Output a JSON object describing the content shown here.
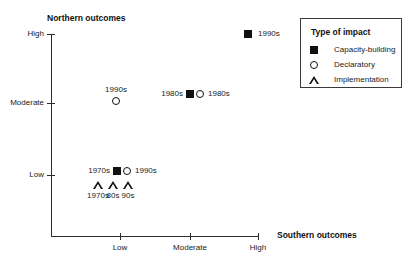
{
  "chart_data": {
    "type": "scatter",
    "title": "",
    "xlabel": "Southern outcomes",
    "ylabel": "Northern outcomes",
    "x_ticks": [
      {
        "label": "Low",
        "px": 120
      },
      {
        "label": "Moderate",
        "px": 190
      },
      {
        "label": "High",
        "px": 258
      }
    ],
    "y_ticks": [
      {
        "label": "High",
        "px": 34
      },
      {
        "label": "Moderate",
        "px": 103
      },
      {
        "label": "Low",
        "px": 175
      }
    ],
    "grid": false,
    "legend": {
      "title": "Type of impact",
      "position": "top-right",
      "entries": [
        {
          "label": "Capacity-building",
          "marker": "filled-square"
        },
        {
          "label": "Declaratory",
          "marker": "open-circle"
        },
        {
          "label": "Implementation",
          "marker": "open-triangle"
        }
      ]
    },
    "points": [
      {
        "id": "capacity-1990s-high",
        "series": "Capacity-building",
        "marker": "filled-square",
        "label": "1990s",
        "label_side": "right",
        "x_value": "High",
        "y_value": "High",
        "px": 248,
        "py": 34,
        "label_px": 258,
        "label_py": 34
      },
      {
        "id": "declaratory-1990s-moderate",
        "series": "Declaratory",
        "marker": "open-circle",
        "label": "1990s",
        "label_side": "above",
        "x_value": "Low",
        "y_value": "Moderate",
        "px": 116,
        "py": 101,
        "label_px": 116,
        "label_py": 86
      },
      {
        "id": "capacity-1980s-moderate",
        "series": "Capacity-building",
        "marker": "filled-square",
        "label": "1980s",
        "label_side": "left",
        "x_value": "Moderate",
        "y_value": "Moderate",
        "px": 190,
        "py": 94,
        "label_px": 183,
        "label_py": 94
      },
      {
        "id": "declaratory-1980s-moderate",
        "series": "Declaratory",
        "marker": "open-circle",
        "label": "1980s",
        "label_side": "right",
        "x_value": "Moderate",
        "y_value": "Moderate",
        "px": 200,
        "py": 94,
        "label_px": 208,
        "label_py": 94
      },
      {
        "id": "capacity-1970s-low",
        "series": "Capacity-building",
        "marker": "filled-square",
        "label": "1970s",
        "label_side": "left",
        "x_value": "Low",
        "y_value": "Low",
        "px": 117,
        "py": 171,
        "label_px": 110,
        "label_py": 171
      },
      {
        "id": "declaratory-1990s-low",
        "series": "Declaratory",
        "marker": "open-circle",
        "label": "1990s",
        "label_side": "right",
        "x_value": "Low",
        "y_value": "Low",
        "px": 127,
        "py": 171,
        "label_px": 135,
        "label_py": 171
      },
      {
        "id": "implementation-1970s",
        "series": "Implementation",
        "marker": "open-triangle",
        "label": "1970s",
        "label_side": "below",
        "x_value": "Low",
        "y_value": "Low",
        "px": 98,
        "py": 185,
        "label_px": 98,
        "label_py": 192
      },
      {
        "id": "implementation-80s",
        "series": "Implementation",
        "marker": "open-triangle",
        "label": "80s",
        "label_side": "below",
        "x_value": "Low",
        "y_value": "Low",
        "px": 113,
        "py": 185,
        "label_px": 113,
        "label_py": 192
      },
      {
        "id": "implementation-90s",
        "series": "Implementation",
        "marker": "open-triangle",
        "label": "90s",
        "label_side": "below",
        "x_value": "Low",
        "y_value": "Low",
        "px": 128,
        "py": 185,
        "label_px": 128,
        "label_py": 192
      }
    ]
  }
}
